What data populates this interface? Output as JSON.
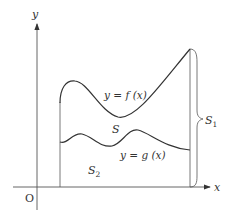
{
  "diagram": {
    "axes": {
      "x_label": "x",
      "y_label": "y",
      "origin_label": "O"
    },
    "curves": {
      "f_label": "y = f (x)",
      "g_label": "y = g (x)"
    },
    "regions": {
      "S": "S",
      "S1": "S",
      "S1_sub": "1",
      "S2": "S",
      "S2_sub": "2"
    },
    "colors": {
      "stroke": "#444444",
      "text": "#333333"
    }
  }
}
